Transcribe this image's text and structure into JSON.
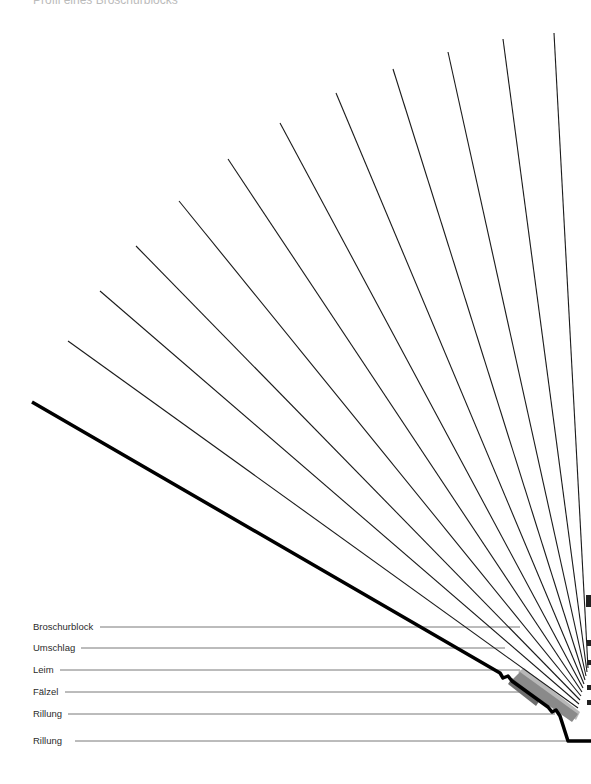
{
  "title": "Profil eines Broschurblocks",
  "labels": [
    {
      "text": "Broschurblock",
      "y": 627
    },
    {
      "text": "Umschlag",
      "y": 648
    },
    {
      "text": "Leim",
      "y": 670
    },
    {
      "text": "Fälzel",
      "y": 692
    },
    {
      "text": "Rillung",
      "y": 714
    },
    {
      "text": "Rillung",
      "y": 741
    }
  ],
  "colors": {
    "line": "#1a1a1a",
    "thick": "#000000",
    "gray_dark": "#6e6e6e",
    "gray_light": "#b8b8b8"
  }
}
